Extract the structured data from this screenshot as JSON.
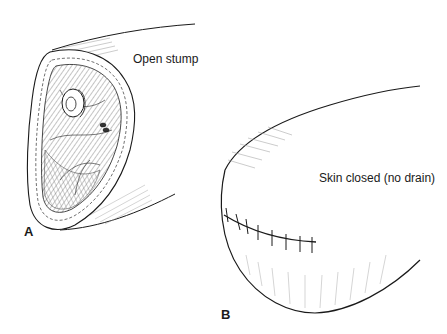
{
  "figure": {
    "panels": [
      {
        "letter": "A",
        "caption": "Open stump"
      },
      {
        "letter": "B",
        "caption": "Skin closed (no drain)"
      }
    ]
  },
  "colors": {
    "line": "#1a1a1a",
    "hatch": "#888888",
    "background": "#ffffff"
  }
}
